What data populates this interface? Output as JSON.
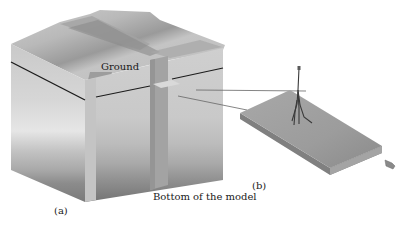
{
  "figure": {
    "labels": {
      "ground": "Ground",
      "bottom": "Bottom of the model",
      "panel_a": "(a)",
      "panel_b": "(b)"
    },
    "colors": {
      "background": "#ffffff",
      "layer_top": "#c8c8c8",
      "layer_light": "#dedede",
      "layer_mid": "#b4b4b4",
      "layer_dark": "#8e8e8e",
      "layer_bottom": "#707070",
      "ground_line": "#1c1c1c",
      "slab": "#9a9a9a",
      "pipe": "#3a3a3a"
    }
  }
}
